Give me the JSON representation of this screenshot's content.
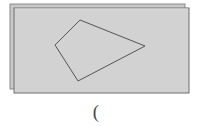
{
  "figure": {
    "kind": "geometry-plane-with-quadrilateral",
    "caption": "(",
    "colors": {
      "plane_fill": "#d2d2d2",
      "plane_fill_back": "#c9c9c9",
      "plane_stroke": "#8a8a8a",
      "plane_stroke_dark": "#6f6f6f",
      "quad_stroke": "#555555",
      "background": "#ffffff",
      "caption_color": "#4a4a4a"
    },
    "layers": [
      {
        "name": "back-plane",
        "label": "back plane sheet",
        "x": 10,
        "y": 4,
        "width": 175,
        "height": 85
      },
      {
        "name": "front-plane",
        "label": "front plane sheet",
        "x": 14,
        "y": 8,
        "width": 175,
        "height": 85
      }
    ],
    "quadrilateral": {
      "name": "quadrilateral",
      "label": "quadrilateral outline",
      "points": "80,20 145,46 78,81 55,45",
      "vertices": [
        {
          "label": "top",
          "x": 80,
          "y": 20
        },
        {
          "label": "right",
          "x": 145,
          "y": 46
        },
        {
          "label": "bottom",
          "x": 78,
          "y": 81
        },
        {
          "label": "left",
          "x": 55,
          "y": 45
        }
      ],
      "stroke_width": 1
    }
  }
}
